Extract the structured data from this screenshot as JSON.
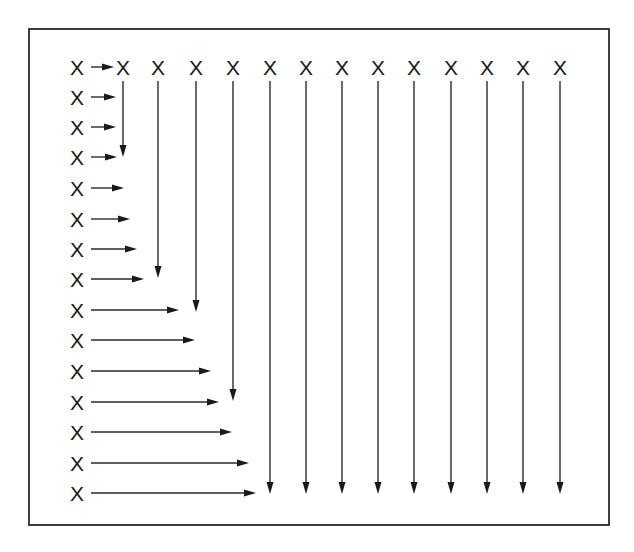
{
  "diagram": {
    "title": "",
    "symbol": "X",
    "colors": {
      "ink": "#1a1a1a",
      "line": "#2a2a2a",
      "background": "#ffffff"
    },
    "frame": {
      "left": 29,
      "top": 29,
      "right": 609,
      "bottom": 525
    },
    "top_row": {
      "y": 67,
      "columns": [
        {
          "x": 77,
          "label": "X",
          "arrow_end_y": null
        },
        {
          "x": 123,
          "label": "X",
          "arrow_end_y": 157
        },
        {
          "x": 158,
          "label": "X",
          "arrow_end_y": 278
        },
        {
          "x": 196,
          "label": "X",
          "arrow_end_y": 312
        },
        {
          "x": 233,
          "label": "X",
          "arrow_end_y": 401
        },
        {
          "x": 270,
          "label": "X",
          "arrow_end_y": 494
        },
        {
          "x": 306,
          "label": "X",
          "arrow_end_y": 494
        },
        {
          "x": 342,
          "label": "X",
          "arrow_end_y": 494
        },
        {
          "x": 378,
          "label": "X",
          "arrow_end_y": 494
        },
        {
          "x": 414,
          "label": "X",
          "arrow_end_y": 494
        },
        {
          "x": 451,
          "label": "X",
          "arrow_end_y": 494
        },
        {
          "x": 487,
          "label": "X",
          "arrow_end_y": 494
        },
        {
          "x": 523,
          "label": "X",
          "arrow_end_y": 494
        },
        {
          "x": 560,
          "label": "X",
          "arrow_end_y": 494
        }
      ]
    },
    "left_column": {
      "x": 77,
      "arrow_start_x": 91,
      "rows": [
        {
          "y": 67,
          "label": "X",
          "arrow_end_x": 114
        },
        {
          "y": 97,
          "label": "X",
          "arrow_end_x": 116
        },
        {
          "y": 127,
          "label": "X",
          "arrow_end_x": 116
        },
        {
          "y": 157,
          "label": "X",
          "arrow_end_x": 117
        },
        {
          "y": 188,
          "label": "X",
          "arrow_end_x": 124
        },
        {
          "y": 219,
          "label": "X",
          "arrow_end_x": 130
        },
        {
          "y": 249,
          "label": "X",
          "arrow_end_x": 137
        },
        {
          "y": 279,
          "label": "X",
          "arrow_end_x": 144
        },
        {
          "y": 310,
          "label": "X",
          "arrow_end_x": 179
        },
        {
          "y": 340,
          "label": "X",
          "arrow_end_x": 195
        },
        {
          "y": 371,
          "label": "X",
          "arrow_end_x": 211
        },
        {
          "y": 402,
          "label": "X",
          "arrow_end_x": 219
        },
        {
          "y": 432,
          "label": "X",
          "arrow_end_x": 232
        },
        {
          "y": 463,
          "label": "X",
          "arrow_end_x": 249
        },
        {
          "y": 493,
          "label": "X",
          "arrow_end_x": 256
        }
      ]
    }
  }
}
